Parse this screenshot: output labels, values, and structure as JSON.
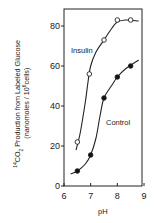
{
  "chart_data": {
    "type": "line",
    "title": "",
    "xlabel": "pH",
    "ylabel": "14CO2 Production from Labeled Glucose (nanomoles / 10^6 cells)",
    "ylabel_line1_prefix": "14",
    "ylabel_line1_main": "CO",
    "ylabel_line1_sub": "2",
    "ylabel_line1_rest": " Production from Labeled Glucose",
    "ylabel_line2_open": "(nanomoles / 10",
    "ylabel_line2_sup": "6",
    "ylabel_line2_close": "cells)",
    "xlim": [
      6,
      9
    ],
    "ylim": [
      0,
      80
    ],
    "xticks": [
      6,
      7,
      8,
      9
    ],
    "yticks": [
      0,
      20,
      40,
      60,
      80
    ],
    "grid": false,
    "legend": "inline labels",
    "series": [
      {
        "name": "Insulin",
        "marker": "open-circle",
        "x": [
          6.5,
          6.95,
          7.5,
          8.0,
          8.5
        ],
        "values": [
          22,
          56,
          73,
          83,
          83
        ],
        "curve_x": [
          6.45,
          6.6,
          6.8,
          6.9,
          7.0,
          7.2,
          7.5,
          7.8,
          8.0,
          8.3,
          8.8
        ],
        "curve_y": [
          18,
          26,
          42,
          52,
          60,
          67,
          73,
          79,
          82,
          83,
          82.5
        ]
      },
      {
        "name": "Control",
        "marker": "filled-circle",
        "x": [
          6.5,
          7.0,
          7.5,
          8.0,
          8.5
        ],
        "values": [
          7.5,
          15.5,
          44,
          54.5,
          60
        ],
        "curve_x": [
          6.25,
          6.5,
          6.8,
          7.0,
          7.2,
          7.35,
          7.5,
          7.8,
          8.0,
          8.3,
          8.8
        ],
        "curve_y": [
          6,
          7.5,
          11,
          15.5,
          24,
          35,
          44,
          50.5,
          54.5,
          58.5,
          63
        ]
      }
    ]
  },
  "labels": {
    "insulin": "Insulin",
    "control": "Control",
    "xaxis": "pH"
  }
}
